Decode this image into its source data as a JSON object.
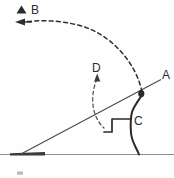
{
  "diagram": {
    "background_color": "#fefefe",
    "ink_color": "#2a2a2a",
    "ground_color": "#8a8a8a",
    "labels": {
      "a": "A",
      "b": "B",
      "c": "C",
      "d": "D"
    },
    "markers": {
      "b_triangle": "triangle-marker",
      "projectile": "projectile-dot"
    },
    "elements": {
      "trajectory_name": "dashed-trajectory-arc",
      "velocity_arrow_name": "velocity-arrow-b",
      "incline_name": "incline-line",
      "ground_name": "ground-line",
      "thrower_name": "thrower-figure",
      "d_arc_name": "dashed-arc-d",
      "d_arrow_name": "arrow-d",
      "launch_pad_name": "launch-pad-mark",
      "smudge_name": "page-smudge"
    }
  }
}
